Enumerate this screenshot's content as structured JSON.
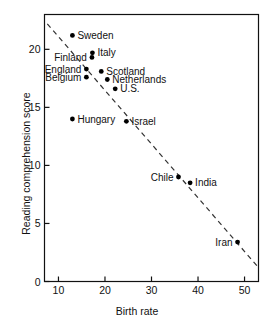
{
  "chart_data": {
    "type": "scatter",
    "title": "",
    "xlabel": "Birth rate",
    "ylabel": "Reading comprehension score",
    "xlim": [
      7,
      53
    ],
    "ylim": [
      0,
      23
    ],
    "xticks": [
      10,
      20,
      30,
      40,
      50
    ],
    "yticks": [
      0,
      5,
      10,
      15,
      20
    ],
    "grid": false,
    "legend": "none",
    "points": [
      {
        "label": "Sweden",
        "x": 13.0,
        "y": 21.2,
        "label_pos": "right"
      },
      {
        "label": "Italy",
        "x": 17.3,
        "y": 19.7,
        "label_pos": "right"
      },
      {
        "label": "Finland",
        "x": 17.2,
        "y": 19.3,
        "label_pos": "left"
      },
      {
        "label": "England",
        "x": 16.0,
        "y": 18.3,
        "label_pos": "left"
      },
      {
        "label": "Scotland",
        "x": 19.2,
        "y": 18.1,
        "label_pos": "right"
      },
      {
        "label": "Belgium",
        "x": 16.0,
        "y": 17.6,
        "label_pos": "left"
      },
      {
        "label": "Netherlands",
        "x": 20.5,
        "y": 17.4,
        "label_pos": "right"
      },
      {
        "label": "U.S.",
        "x": 22.2,
        "y": 16.6,
        "label_pos": "right"
      },
      {
        "label": "Hungary",
        "x": 13.0,
        "y": 14.0,
        "label_pos": "right"
      },
      {
        "label": "Israel",
        "x": 24.6,
        "y": 13.8,
        "label_pos": "right"
      },
      {
        "label": "Chile",
        "x": 35.8,
        "y": 9.0,
        "label_pos": "left"
      },
      {
        "label": "India",
        "x": 38.3,
        "y": 8.5,
        "label_pos": "right"
      },
      {
        "label": "Iran",
        "x": 48.5,
        "y": 3.4,
        "label_pos": "left"
      }
    ],
    "trendline": {
      "style": "dashed",
      "x1": 7.6,
      "y1": 22.2,
      "x2": 53.0,
      "y2": 1.2
    },
    "colors": {
      "axis": "#111111",
      "marker": "#000000",
      "trendline": "#333333",
      "background": "#ffffff"
    }
  }
}
